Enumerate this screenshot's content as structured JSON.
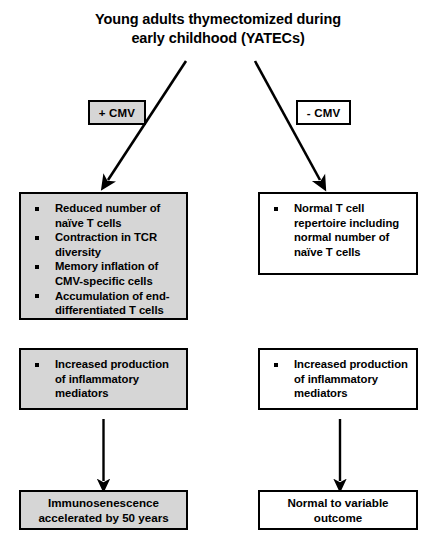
{
  "figure": {
    "type": "flowchart",
    "title": {
      "line1": "Young adults thymectomized during",
      "line2": "early childhood (YATECs)"
    },
    "branches": {
      "left": {
        "condition_label": "+ CMV",
        "condition_shaded": true,
        "t_cell_findings": [
          "Reduced number of naïve T cells",
          "Contraction in TCR diversity",
          "Memory inflation of CMV-specific cells",
          "Accumulation of end-differentiated T cells"
        ],
        "inflammation": [
          "Increased production of inflammatory mediators"
        ],
        "outcome": {
          "line1": "Immunosenescence",
          "line2": "accelerated by 50 years"
        }
      },
      "right": {
        "condition_label": "- CMV",
        "condition_shaded": false,
        "t_cell_findings": [
          "Normal T cell repertoire including normal number of naïve T cells"
        ],
        "inflammation": [
          "Increased production of inflammatory mediators"
        ],
        "outcome": {
          "line1": "Normal to variable",
          "line2": "outcome"
        }
      }
    },
    "colors": {
      "shaded_fill": "#d6d6d6",
      "plain_fill": "#ffffff",
      "stroke": "#000000",
      "text": "#000000"
    }
  }
}
